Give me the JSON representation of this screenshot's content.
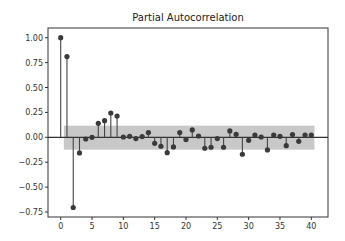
{
  "chart_data": {
    "type": "stem",
    "title": "Partial Autocorrelation",
    "xlabel": "",
    "ylabel": "",
    "x": [
      0,
      1,
      2,
      3,
      4,
      5,
      6,
      7,
      8,
      9,
      10,
      11,
      12,
      13,
      14,
      15,
      16,
      17,
      18,
      19,
      20,
      21,
      22,
      23,
      24,
      25,
      26,
      27,
      28,
      29,
      30,
      31,
      32,
      33,
      34,
      35,
      36,
      37,
      38,
      39,
      40
    ],
    "values": [
      1.0,
      0.81,
      -0.705,
      -0.157,
      -0.017,
      0.0,
      0.14,
      0.167,
      0.244,
      0.214,
      0.003,
      0.01,
      -0.013,
      0.007,
      0.047,
      -0.06,
      -0.09,
      -0.154,
      -0.097,
      0.047,
      -0.023,
      0.074,
      0.013,
      -0.11,
      -0.1,
      -0.013,
      -0.1,
      0.064,
      0.03,
      -0.17,
      -0.03,
      0.023,
      0.003,
      -0.127,
      0.023,
      0.01,
      -0.084,
      0.027,
      -0.04,
      0.023,
      0.023
    ],
    "confidence_band": {
      "upper": 0.117,
      "lower": -0.124,
      "x_start": 0.5,
      "x_end": 40.5
    },
    "xlim": [
      -2,
      42.5
    ],
    "ylim": [
      -0.79,
      1.08
    ],
    "xticks": [
      0,
      5,
      10,
      15,
      20,
      25,
      30,
      35,
      40
    ],
    "xtick_labels": [
      "0",
      "5",
      "10",
      "15",
      "20",
      "25",
      "30",
      "35",
      "40"
    ],
    "yticks": [
      1.0,
      0.75,
      0.5,
      0.25,
      0.0,
      -0.25,
      -0.5,
      -0.75
    ],
    "ytick_labels": [
      "1.00",
      "0.75",
      "0.50",
      "0.25",
      "0.00",
      "−0.25",
      "−0.50",
      "−0.75"
    ],
    "grid": false,
    "legend": null,
    "colors": {
      "stem": "#444444",
      "marker": "#3a3a3a",
      "band": "#c8c8c8",
      "zero_line": "#333333",
      "spine": "#333333"
    }
  }
}
